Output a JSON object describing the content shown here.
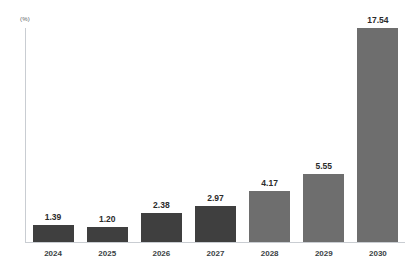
{
  "chart_data": {
    "type": "bar",
    "title": "",
    "subtitle": "",
    "xlabel": "",
    "ylabel": "(%)",
    "unit_label": "(%)",
    "categories": [
      "2024",
      "2025",
      "2026",
      "2027",
      "2028",
      "2029",
      "2030"
    ],
    "values": [
      1.39,
      1.2,
      2.38,
      2.97,
      4.17,
      5.55,
      17.54
    ],
    "value_labels": [
      "1.39",
      "1.20",
      "2.38",
      "2.97",
      "4.17",
      "5.55",
      "17.54"
    ],
    "bar_colors": [
      "#3f3f3f",
      "#3f3f3f",
      "#3f3f3f",
      "#3f3f3f",
      "#6e6e6e",
      "#6e6e6e",
      "#6e6e6e"
    ],
    "ylim": [
      0,
      17.54
    ],
    "grid": false,
    "legend": "none",
    "axis_color": "#c9cdd2",
    "background": "#ffffff",
    "label_color": "#2b2b2b"
  }
}
